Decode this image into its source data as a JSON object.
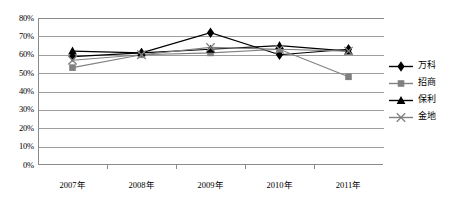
{
  "chart_data": {
    "type": "line",
    "title": "",
    "xlabel": "",
    "ylabel": "",
    "categories": [
      "2007年",
      "2008年",
      "2009年",
      "2010年",
      "2011年"
    ],
    "ylim": [
      0,
      80
    ],
    "ytick_labels": [
      "0%",
      "10%",
      "20%",
      "30%",
      "40%",
      "50%",
      "60%",
      "70%",
      "80%"
    ],
    "ytick_values": [
      0,
      10,
      20,
      30,
      40,
      50,
      60,
      70,
      80
    ],
    "grid": true,
    "legend_position": "right",
    "series": [
      {
        "name": "万科",
        "marker": "diamond",
        "color": "#000000",
        "values": [
          59,
          61,
          72,
          60,
          63
        ]
      },
      {
        "name": "招商",
        "marker": "square",
        "color": "#808080",
        "values": [
          53,
          60,
          61,
          63,
          48
        ]
      },
      {
        "name": "保利",
        "marker": "triangle",
        "color": "#000000",
        "values": [
          62,
          61,
          63,
          65,
          62
        ]
      },
      {
        "name": "金地",
        "marker": "x",
        "color": "#808080",
        "values": [
          57,
          60,
          64,
          63,
          62
        ]
      }
    ]
  },
  "legend": {
    "items": [
      {
        "label": "万科",
        "marker": "diamond"
      },
      {
        "label": "招商",
        "marker": "square"
      },
      {
        "label": "保利",
        "marker": "triangle"
      },
      {
        "label": "金地",
        "marker": "x"
      }
    ]
  },
  "colors": {
    "axis": "#8a8a8a",
    "grid": "#9e9e9e",
    "series_dark": "#000000",
    "series_gray": "#808080",
    "background": "#ffffff"
  }
}
